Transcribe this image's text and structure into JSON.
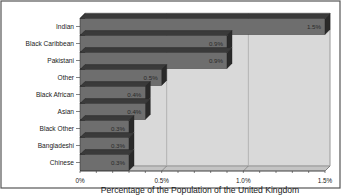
{
  "chart_data": {
    "type": "bar",
    "orientation": "horizontal",
    "style": "3d",
    "title": "",
    "categories": [
      "Indian",
      "Black Caribbean",
      "Pakistani",
      "Other",
      "Black African",
      "Asian",
      "Black Other",
      "Bangladeshi",
      "Chinese"
    ],
    "values": [
      1.5,
      0.9,
      0.9,
      0.5,
      0.4,
      0.4,
      0.3,
      0.3,
      0.3
    ],
    "value_labels": [
      "1.5%",
      "0.9%",
      "0.9%",
      "0.5%",
      "0.4%",
      "0.4%",
      "0.3%",
      "0.3%",
      "0.3%"
    ],
    "xlabel": "Percentage of the Population of the United Kingdom",
    "ylabel": "",
    "xlim": [
      0,
      1.5
    ],
    "x_ticks": [
      0,
      0.5,
      1.0,
      1.5
    ],
    "x_tick_labels": [
      "0%",
      "0.5%",
      "1.0%",
      "1.5%"
    ],
    "grid": "vertical major",
    "legend": "none",
    "colors": {
      "bar_front": "#6e6e6e",
      "bar_top": "#3a3a3a",
      "bar_side": "#2a2a2a",
      "plot_wall": "#d9d9d9",
      "gridline": "#a8a8a8",
      "border": "#555555"
    }
  },
  "caption": "This bar chart shows ... in the UK in the 1991 Census"
}
